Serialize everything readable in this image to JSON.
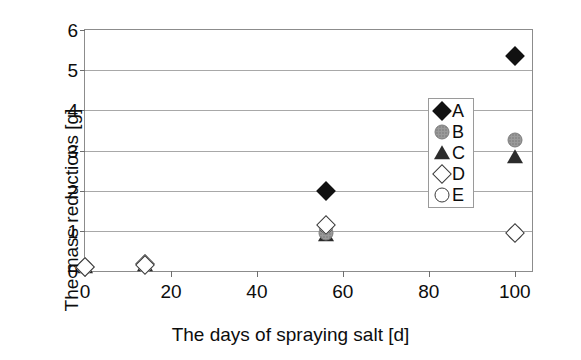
{
  "chart_data": {
    "type": "scatter",
    "title": "",
    "xlabel": "The days of spraying salt [d]",
    "ylabel": "The mass reductions [g]",
    "xlim": [
      0,
      104
    ],
    "ylim": [
      0,
      6
    ],
    "xticks": [
      0,
      20,
      40,
      60,
      80,
      100
    ],
    "yticks": [
      0,
      1,
      2,
      3,
      4,
      5,
      6
    ],
    "xtick_labels": [
      "0",
      "20",
      "40",
      "60",
      "80",
      "100"
    ],
    "ytick_labels": [
      "0",
      "1",
      "2",
      "3",
      "4",
      "5",
      "6"
    ],
    "grid": "horizontal",
    "legend_position": "center-right",
    "x": [
      0,
      14,
      56,
      100
    ],
    "series": [
      {
        "name": "A",
        "marker": "filled-diamond",
        "color": "#111111",
        "values": [
          0.1,
          0.18,
          2.0,
          5.35
        ]
      },
      {
        "name": "B",
        "marker": "gray-dotted-circle",
        "color": "#9a9a9a",
        "values": [
          0.1,
          0.15,
          0.95,
          3.25
        ]
      },
      {
        "name": "C",
        "marker": "filled-triangle",
        "color": "#2b2b2b",
        "values": [
          0.1,
          0.15,
          0.9,
          2.85
        ]
      },
      {
        "name": "D",
        "marker": "open-diamond",
        "color": "#ffffff",
        "values": [
          0.1,
          0.15,
          1.15,
          0.95
        ]
      },
      {
        "name": "E",
        "marker": "open-circle",
        "color": "#ffffff",
        "values": [
          0.1,
          0.15,
          1.12,
          0.95
        ]
      }
    ]
  },
  "legend": {
    "entries": [
      {
        "label": "A",
        "marker": "filled-diamond"
      },
      {
        "label": "B",
        "marker": "gray-dotted-circle"
      },
      {
        "label": "C",
        "marker": "filled-triangle"
      },
      {
        "label": "D",
        "marker": "open-diamond"
      },
      {
        "label": "E",
        "marker": "open-circle"
      }
    ]
  }
}
